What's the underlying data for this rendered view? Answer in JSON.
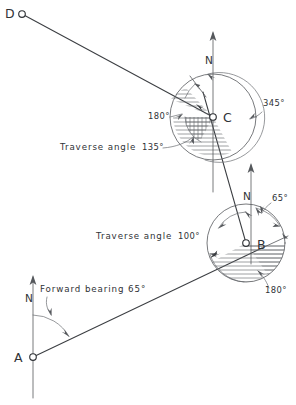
{
  "diagram": {
    "stations": [
      {
        "id": "D",
        "label": "D",
        "x": 22,
        "y": 14
      },
      {
        "id": "C",
        "label": "C",
        "x": 213,
        "y": 117
      },
      {
        "id": "B",
        "label": "B",
        "x": 246,
        "y": 243
      },
      {
        "id": "A",
        "label": "A",
        "x": 33,
        "y": 357
      }
    ],
    "north_markers": [
      {
        "id": "north-at-c",
        "label": "N",
        "x": 213,
        "y": 60
      },
      {
        "id": "north-at-b",
        "label": "N",
        "x": 251,
        "y": 196
      },
      {
        "id": "north-at-a",
        "label": "N",
        "x": 27,
        "y": 298
      }
    ],
    "annotations": [
      {
        "id": "forward-bearing-a",
        "text": "Forward bearing 65°",
        "x": 40,
        "y": 292
      },
      {
        "id": "traverse-angle-c",
        "text": "Traverse angle",
        "x": 60,
        "y": 150
      },
      {
        "id": "traverse-angle-c-value",
        "text": "135°",
        "x": 142,
        "y": 150
      },
      {
        "id": "traverse-angle-b",
        "text": "Traverse angle",
        "x": 96,
        "y": 239
      },
      {
        "id": "traverse-angle-b-value",
        "text": "100°",
        "x": 178,
        "y": 239
      },
      {
        "id": "bearing-345-at-c",
        "text": "345°",
        "x": 263,
        "y": 106
      },
      {
        "id": "bearing-180-at-c",
        "text": "180°",
        "x": 148,
        "y": 119
      },
      {
        "id": "bearing-65-at-b",
        "text": "65°",
        "x": 272,
        "y": 201
      },
      {
        "id": "bearing-180-at-b",
        "text": "180°",
        "x": 265,
        "y": 293
      }
    ],
    "traverse_legs": [
      {
        "id": "leg-a-b",
        "from": "A",
        "to": "B"
      },
      {
        "id": "leg-b-c",
        "from": "B",
        "to": "C"
      },
      {
        "id": "leg-c-d",
        "from": "C",
        "to": "D"
      }
    ],
    "colors": {
      "line": "#3b3e42",
      "thin_line": "#55585c",
      "hatch": "#6a6d71",
      "text": "#2f3236",
      "background": "#ffffff"
    }
  }
}
